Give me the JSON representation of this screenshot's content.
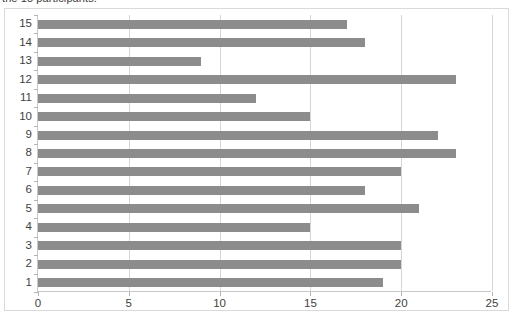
{
  "caption": {
    "text": "the 15 participants."
  },
  "chart_data": {
    "type": "bar",
    "orientation": "horizontal",
    "title": "",
    "xlabel": "",
    "ylabel": "",
    "categories": [
      "1",
      "2",
      "3",
      "4",
      "5",
      "6",
      "7",
      "8",
      "9",
      "10",
      "11",
      "12",
      "13",
      "14",
      "15"
    ],
    "values": [
      19,
      20,
      20,
      15,
      21,
      18,
      20,
      23,
      22,
      15,
      12,
      23,
      9,
      18,
      17
    ],
    "xlim": [
      0,
      25
    ],
    "xticks": [
      "0",
      "5",
      "10",
      "15",
      "20",
      "25"
    ],
    "xtick_values": [
      0,
      5,
      10,
      15,
      20,
      25
    ],
    "grid": "vertical",
    "legend": "none",
    "bar_color": "#8c8c8c",
    "gridline_color": "#d6d6d6",
    "axis_color": "#c8c8c8",
    "border_color": "#d9d9d9",
    "background": "#ffffff",
    "category_display_order": [
      "15",
      "14",
      "13",
      "12",
      "11",
      "10",
      "9",
      "8",
      "7",
      "6",
      "5",
      "4",
      "3",
      "2",
      "1"
    ]
  }
}
